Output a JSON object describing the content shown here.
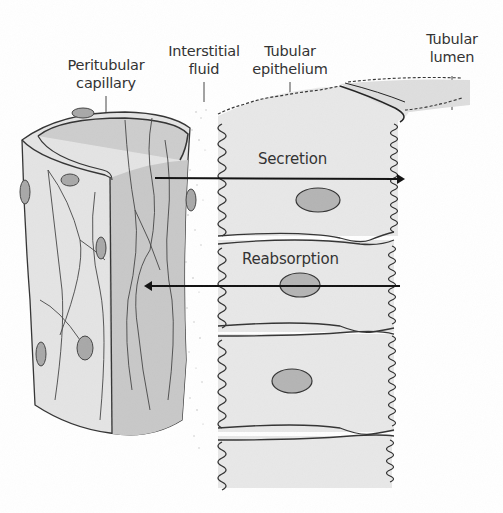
{
  "diagram": {
    "labels": {
      "peritubular_capillary": {
        "line1": "Peritubular",
        "line2": "capillary"
      },
      "interstitial_fluid": {
        "line1": "Interstitial",
        "line2": "fluid"
      },
      "tubular_epithelium": {
        "line1": "Tubular",
        "line2": "epithelium"
      },
      "tubular_lumen": {
        "line1": "Tubular",
        "line2": "lumen"
      }
    },
    "arrows": [
      {
        "label": "Secretion",
        "direction": "capillary-to-lumen"
      },
      {
        "label": "Reabsorption",
        "direction": "lumen-to-capillary"
      }
    ],
    "colors": {
      "outline": "#333333",
      "capillary_outer": "#e4e4e4",
      "capillary_inner": "#c6c6c6",
      "epithelium_cell": "#e8e8e8",
      "nucleus": "#a8a8a8",
      "text": "#333333"
    }
  }
}
